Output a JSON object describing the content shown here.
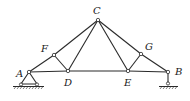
{
  "diagram": {
    "type": "truss",
    "nodes": {
      "A": {
        "label": "A",
        "x": 29,
        "y": 72,
        "lx": 16,
        "ly": 77
      },
      "B": {
        "label": "B",
        "x": 168,
        "y": 72,
        "lx": 175,
        "ly": 75
      },
      "C": {
        "label": "C",
        "x": 98,
        "y": 20,
        "lx": 93,
        "ly": 14
      },
      "D": {
        "label": "D",
        "x": 68,
        "y": 71,
        "lx": 64,
        "ly": 86
      },
      "E": {
        "label": "E",
        "x": 128,
        "y": 71,
        "lx": 124,
        "ly": 86
      },
      "F": {
        "label": "F",
        "x": 54,
        "y": 55,
        "lx": 41,
        "ly": 52
      },
      "G": {
        "label": "G",
        "x": 141,
        "y": 54,
        "lx": 145,
        "ly": 50
      }
    },
    "members": [
      [
        "A",
        "F"
      ],
      [
        "F",
        "C"
      ],
      [
        "C",
        "G"
      ],
      [
        "G",
        "B"
      ],
      [
        "A",
        "D"
      ],
      [
        "D",
        "E"
      ],
      [
        "E",
        "B"
      ],
      [
        "F",
        "D"
      ],
      [
        "D",
        "C"
      ],
      [
        "C",
        "E"
      ],
      [
        "E",
        "G"
      ]
    ],
    "supports": {
      "A": "pin",
      "B": "roller"
    },
    "colors": {
      "line": "#2a2a2a",
      "background": "#ffffff"
    }
  }
}
